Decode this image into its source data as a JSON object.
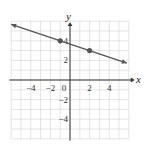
{
  "chart_data": {
    "type": "line",
    "title": "",
    "xlabel": "x",
    "ylabel": "y",
    "xlim": [
      -6,
      6
    ],
    "ylim": [
      -6,
      6
    ],
    "grid": true,
    "x_ticks": [
      -4,
      -2,
      0,
      2,
      4
    ],
    "y_ticks": [
      4,
      2,
      -2,
      -4
    ],
    "x_tick_labels": [
      "−4",
      "−2",
      "0",
      "2",
      "4"
    ],
    "y_tick_labels": [
      "4",
      "2",
      "−2",
      "−4"
    ],
    "series": [
      {
        "name": "line",
        "equation": "y = -x/3 + 11/3",
        "slope": -0.3333,
        "intercept": 3.667,
        "x": [
          -6,
          5.8
        ],
        "y": [
          5.667,
          1.733
        ],
        "arrows": "both",
        "color": "#555555"
      }
    ],
    "points": [
      {
        "x": -1,
        "y": 4
      },
      {
        "x": 2,
        "y": 3
      }
    ]
  },
  "colors": {
    "grid": "#d9d9d9",
    "axis": "#333333",
    "line": "#555555",
    "point": "#555555"
  }
}
